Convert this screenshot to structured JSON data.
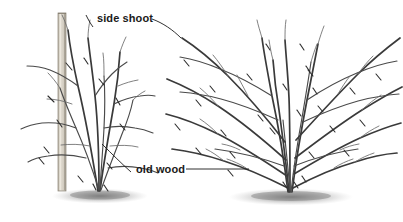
{
  "figure": {
    "width": 403,
    "height": 222,
    "background_color": "#ffffff",
    "line_color": "#4a4a4a",
    "line_color_dark": "#3a3a3a",
    "label_color": "#1a1a1a",
    "stake_color": "#cfc9bd",
    "ground_color": "#9a9a9a"
  },
  "labels": {
    "side_shoot": "side shoot",
    "old_wood": "old wood"
  },
  "plants": {
    "left": {
      "name": "staked upright shrub",
      "has_stake": true,
      "ground_center_x": 100,
      "ground_center_y": 196
    },
    "right": {
      "name": "spreading shrub",
      "has_stake": false,
      "ground_center_x": 290,
      "ground_center_y": 196
    }
  }
}
